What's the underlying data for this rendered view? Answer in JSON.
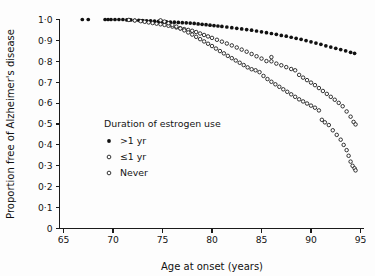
{
  "chart_data": {
    "type": "scatter",
    "title": "",
    "xlabel": "Age at onset (years)",
    "ylabel": "Proportion free of Alzheimer's disease",
    "xlim": [
      64.0,
      95.6
    ],
    "ylim": [
      0,
      1.0
    ],
    "grid": false,
    "xticks": [
      65,
      70,
      75,
      80,
      85,
      90,
      95
    ],
    "xticklabels": [
      "65",
      "70",
      "75",
      "80",
      "85",
      "90",
      "95"
    ],
    "yticks": [
      0,
      0.1,
      0.2,
      0.3,
      0.4,
      0.5,
      0.6,
      0.7,
      0.8,
      0.9,
      1.0
    ],
    "yticklabels": [
      "0",
      "0·1",
      "0·2",
      "0·3",
      "0·4",
      "0·5",
      "0·6",
      "0·7",
      "0·8",
      "0·9",
      "1·0"
    ],
    "legend": {
      "title": "Duration of  estrogen use",
      "position": "center-left",
      "entries": [
        {
          "label": ">1 yr",
          "marker": "filled-circle",
          "color": "#111111"
        },
        {
          "label": "≤1 yr",
          "marker": "open-circle",
          "color": "#111111"
        },
        {
          "label": "Never",
          "marker": "open-circle",
          "color": "#111111"
        }
      ]
    },
    "series": [
      {
        "name": ">1 yr",
        "marker": "filled-circle",
        "color": "#111111",
        "points": [
          [
            66.9,
            1.0
          ],
          [
            67.5,
            1.0
          ],
          [
            69.2,
            1.0
          ],
          [
            69.5,
            1.0
          ],
          [
            69.8,
            1.0
          ],
          [
            70.2,
            1.0
          ],
          [
            70.6,
            1.0
          ],
          [
            71.0,
            1.0
          ],
          [
            71.4,
            0.998
          ],
          [
            71.8,
            0.998
          ],
          [
            72.2,
            0.996
          ],
          [
            72.6,
            0.996
          ],
          [
            73.0,
            0.995
          ],
          [
            73.4,
            0.994
          ],
          [
            73.8,
            0.993
          ],
          [
            74.2,
            0.992
          ],
          [
            74.6,
            0.991
          ],
          [
            75.0,
            0.99
          ],
          [
            75.4,
            0.989
          ],
          [
            75.8,
            0.988
          ],
          [
            76.2,
            0.987
          ],
          [
            76.6,
            0.986
          ],
          [
            77.0,
            0.985
          ],
          [
            77.4,
            0.984
          ],
          [
            77.8,
            0.983
          ],
          [
            78.2,
            0.981
          ],
          [
            78.6,
            0.979
          ],
          [
            79.0,
            0.977
          ],
          [
            79.4,
            0.975
          ],
          [
            79.8,
            0.973
          ],
          [
            80.2,
            0.971
          ],
          [
            80.6,
            0.969
          ],
          [
            81.0,
            0.967
          ],
          [
            81.5,
            0.964
          ],
          [
            82.0,
            0.961
          ],
          [
            82.5,
            0.958
          ],
          [
            83.0,
            0.955
          ],
          [
            83.5,
            0.952
          ],
          [
            84.0,
            0.949
          ],
          [
            84.5,
            0.945
          ],
          [
            85.0,
            0.941
          ],
          [
            85.5,
            0.937
          ],
          [
            86.0,
            0.933
          ],
          [
            86.5,
            0.929
          ],
          [
            87.0,
            0.924
          ],
          [
            87.5,
            0.92
          ],
          [
            88.0,
            0.915
          ],
          [
            88.5,
            0.91
          ],
          [
            89.0,
            0.905
          ],
          [
            89.5,
            0.899
          ],
          [
            90.0,
            0.893
          ],
          [
            90.5,
            0.887
          ],
          [
            91.0,
            0.881
          ],
          [
            91.5,
            0.874
          ],
          [
            92.0,
            0.868
          ],
          [
            92.5,
            0.862
          ],
          [
            93.0,
            0.856
          ],
          [
            93.5,
            0.85
          ],
          [
            94.0,
            0.843
          ],
          [
            94.4,
            0.838
          ]
        ]
      },
      {
        "name": "≤1 yr",
        "marker": "open-circle",
        "color": "#111111",
        "points": [
          [
            71.6,
            0.998
          ],
          [
            72.2,
            0.995
          ],
          [
            72.8,
            0.992
          ],
          [
            73.2,
            0.989
          ],
          [
            73.6,
            0.986
          ],
          [
            74.0,
            0.983
          ],
          [
            74.4,
            0.98
          ],
          [
            74.8,
            0.977
          ],
          [
            75.2,
            0.974
          ],
          [
            75.6,
            0.97
          ],
          [
            76.0,
            0.966
          ],
          [
            76.4,
            0.962
          ],
          [
            76.8,
            0.958
          ],
          [
            77.2,
            0.954
          ],
          [
            77.6,
            0.95
          ],
          [
            78.0,
            0.946
          ],
          [
            78.4,
            0.94
          ],
          [
            78.8,
            0.933
          ],
          [
            79.2,
            0.926
          ],
          [
            79.6,
            0.919
          ],
          [
            80.0,
            0.912
          ],
          [
            80.5,
            0.903
          ],
          [
            81.0,
            0.894
          ],
          [
            81.5,
            0.885
          ],
          [
            82.0,
            0.876
          ],
          [
            82.5,
            0.866
          ],
          [
            83.0,
            0.856
          ],
          [
            83.5,
            0.846
          ],
          [
            84.0,
            0.835
          ],
          [
            84.5,
            0.824
          ],
          [
            85.0,
            0.813
          ],
          [
            85.5,
            0.801
          ],
          [
            86.0,
            0.82
          ],
          [
            86.0,
            0.8
          ],
          [
            86.5,
            0.789
          ],
          [
            87.0,
            0.781
          ],
          [
            87.5,
            0.772
          ],
          [
            88.0,
            0.763
          ],
          [
            88.4,
            0.757
          ],
          [
            88.8,
            0.735
          ],
          [
            89.2,
            0.722
          ],
          [
            89.6,
            0.71
          ],
          [
            90.0,
            0.698
          ],
          [
            90.4,
            0.686
          ],
          [
            90.8,
            0.672
          ],
          [
            91.2,
            0.658
          ],
          [
            91.6,
            0.644
          ],
          [
            92.0,
            0.63
          ],
          [
            92.4,
            0.616
          ],
          [
            92.8,
            0.601
          ],
          [
            93.2,
            0.585
          ],
          [
            93.6,
            0.56
          ],
          [
            94.0,
            0.535
          ],
          [
            94.3,
            0.51
          ],
          [
            94.5,
            0.498
          ]
        ]
      },
      {
        "name": "Never",
        "marker": "open-circle",
        "color": "#111111",
        "points": [
          [
            74.8,
            0.996
          ],
          [
            75.2,
            0.99
          ],
          [
            75.6,
            0.982
          ],
          [
            76.0,
            0.974
          ],
          [
            76.4,
            0.966
          ],
          [
            76.8,
            0.957
          ],
          [
            77.2,
            0.948
          ],
          [
            77.6,
            0.938
          ],
          [
            78.0,
            0.928
          ],
          [
            78.4,
            0.917
          ],
          [
            78.8,
            0.906
          ],
          [
            79.2,
            0.895
          ],
          [
            79.6,
            0.884
          ],
          [
            80.0,
            0.873
          ],
          [
            80.4,
            0.861
          ],
          [
            80.8,
            0.849
          ],
          [
            81.2,
            0.838
          ],
          [
            81.6,
            0.826
          ],
          [
            82.0,
            0.815
          ],
          [
            82.4,
            0.804
          ],
          [
            82.8,
            0.793
          ],
          [
            83.2,
            0.782
          ],
          [
            83.6,
            0.771
          ],
          [
            84.0,
            0.762
          ],
          [
            84.4,
            0.757
          ],
          [
            84.8,
            0.748
          ],
          [
            85.2,
            0.73
          ],
          [
            85.6,
            0.715
          ],
          [
            86.0,
            0.702
          ],
          [
            86.4,
            0.69
          ],
          [
            86.8,
            0.678
          ],
          [
            87.2,
            0.666
          ],
          [
            87.6,
            0.654
          ],
          [
            88.0,
            0.642
          ],
          [
            88.4,
            0.63
          ],
          [
            88.8,
            0.618
          ],
          [
            89.2,
            0.608
          ],
          [
            89.6,
            0.598
          ],
          [
            90.0,
            0.588
          ],
          [
            90.4,
            0.578
          ],
          [
            90.8,
            0.565
          ],
          [
            91.1,
            0.52
          ],
          [
            91.4,
            0.508
          ],
          [
            91.8,
            0.495
          ],
          [
            92.2,
            0.47
          ],
          [
            92.6,
            0.448
          ],
          [
            93.0,
            0.425
          ],
          [
            93.3,
            0.4
          ],
          [
            93.6,
            0.375
          ],
          [
            93.8,
            0.348
          ],
          [
            94.0,
            0.32
          ],
          [
            94.2,
            0.3
          ],
          [
            94.4,
            0.288
          ],
          [
            94.5,
            0.278
          ]
        ]
      }
    ]
  }
}
